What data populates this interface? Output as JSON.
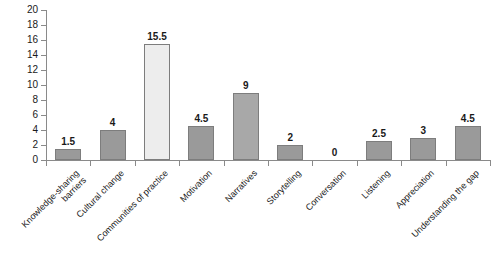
{
  "chart_data": {
    "type": "bar",
    "title": "",
    "subtitle": "",
    "xlabel": "",
    "ylabel": "",
    "ylim": [
      0,
      20
    ],
    "ytick_step": 2,
    "yticks": [
      0,
      2,
      4,
      6,
      8,
      10,
      12,
      14,
      16,
      18,
      20
    ],
    "grid": false,
    "legend": false,
    "legend_position": "none",
    "categories": [
      "Knowledge-sharing barriers",
      "Cultural change",
      "Communities of practice",
      "Motivation",
      "Narratives",
      "Storytelling",
      "Conversation",
      "Listening",
      "Appreciation",
      "Understanding the gap"
    ],
    "category_label_lines": [
      [
        "Knowledge-sharing",
        "barriers"
      ],
      [
        "Cultural change"
      ],
      [
        "Communities of practice"
      ],
      [
        "Motivation"
      ],
      [
        "Narratives"
      ],
      [
        "Storytelling"
      ],
      [
        "Conversation"
      ],
      [
        "Listening"
      ],
      [
        "Appreciation"
      ],
      [
        "Understanding the gap"
      ]
    ],
    "values": [
      1.5,
      4,
      15.5,
      4.5,
      9,
      2,
      0,
      2.5,
      3,
      4.5
    ],
    "value_labels": [
      "1.5",
      "4",
      "15.5",
      "4.5",
      "9",
      "2",
      "0",
      "2.5",
      "3",
      "4.5"
    ],
    "bar_colors": [
      "#9a9a9a",
      "#9a9a9a",
      "#ededed",
      "#9a9a9a",
      "#a8a8a8",
      "#9a9a9a",
      "#9a9a9a",
      "#9a9a9a",
      "#9a9a9a",
      "#9a9a9a"
    ],
    "bar_border_color": "#7d7d7d",
    "axis_color": "#8a8a8a",
    "text_color": "#1a1a1a",
    "background_color": "#ffffff"
  }
}
